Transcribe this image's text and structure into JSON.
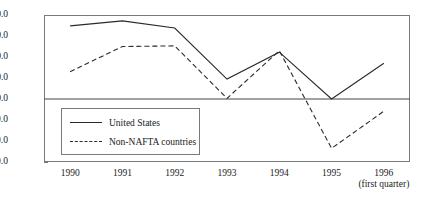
{
  "chart_data": {
    "type": "line",
    "title": "",
    "subtitle": "",
    "xlabel": "",
    "ylabel": "",
    "x": [
      "1990",
      "1991",
      "1992",
      "1993",
      "1994",
      "1995",
      "1996"
    ],
    "categories": [
      "1990",
      "1991",
      "1992",
      "1993",
      "1994",
      "1995",
      "1996"
    ],
    "x_tick_labels": [
      "1990",
      "1991",
      "1992",
      "1993",
      "1994",
      "1995",
      "1996"
    ],
    "x_note": "(first quarter)",
    "x_note_attached_to": "1996",
    "y_tick_labels": [
      "40.0",
      "30.0",
      "20.0",
      "10.0",
      "0.0",
      "-10.0",
      "-20.0",
      "-30.0"
    ],
    "y_ticks": [
      40.0,
      30.0,
      20.0,
      10.0,
      0.0,
      -10.0,
      -20.0,
      -30.0
    ],
    "ylim": [
      -30.0,
      40.0
    ],
    "grid": false,
    "zero_line": true,
    "legend_position": "inside-lower-left",
    "series": [
      {
        "name": "United States",
        "style": "solid",
        "color": "#2a2a2a",
        "values": [
          34.8,
          37.2,
          33.8,
          9.5,
          22.3,
          0.0,
          17.0
        ]
      },
      {
        "name": "Non-NAFTA countries",
        "style": "dashed",
        "color": "#2a2a2a",
        "values": [
          13.0,
          25.0,
          25.3,
          0.3,
          23.0,
          -23.5,
          -5.8
        ]
      }
    ]
  },
  "legend": {
    "items": [
      {
        "label": "United States",
        "style": "solid"
      },
      {
        "label": "Non-NAFTA countries",
        "style": "dashed"
      }
    ]
  },
  "colors": {
    "line": "#2a2a2a",
    "frame": "#7a7a7a",
    "axis": "#444444",
    "background": "#ffffff"
  }
}
